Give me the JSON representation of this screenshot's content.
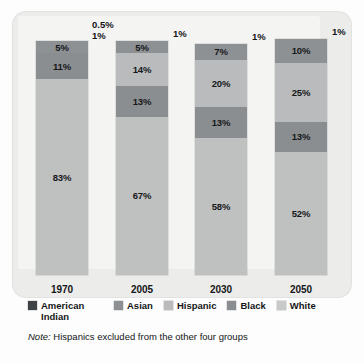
{
  "chart_data": {
    "type": "bar",
    "subtype": "stacked-100-percent",
    "title": "",
    "xlabel": "",
    "ylabel": "",
    "ylim": [
      0,
      100
    ],
    "grid": false,
    "legend_position": "bottom",
    "categories": [
      "1970",
      "2005",
      "2030",
      "2050"
    ],
    "series": [
      {
        "name": "American Indian",
        "color": "#3f4346",
        "values": [
          0.5,
          1,
          1,
          1
        ],
        "labels": [
          "0.5%",
          "1%",
          "1%",
          "1%"
        ],
        "label_outside": true
      },
      {
        "name": "Asian",
        "color": "#8e9194",
        "values": [
          1,
          5,
          7,
          10
        ],
        "labels": [
          "1%",
          "5%",
          "7%",
          "10%"
        ]
      },
      {
        "name": "Hispanic",
        "color": "#b9bbbc",
        "values": [
          5,
          14,
          20,
          25
        ],
        "labels": [
          "5%",
          "14%",
          "20%",
          "25%"
        ]
      },
      {
        "name": "Black",
        "color": "#8b8e90",
        "values": [
          11,
          13,
          13,
          13
        ],
        "labels": [
          "11%",
          "13%",
          "13%",
          "13%"
        ]
      },
      {
        "name": "White",
        "color": "#bfc1c1",
        "values": [
          83,
          67,
          58,
          52
        ],
        "labels": [
          "83%",
          "67%",
          "58%",
          "52%"
        ]
      }
    ],
    "bars": [
      {
        "year": "1970",
        "outside_labels": [
          "0.5%",
          "1%"
        ],
        "segments": [
          {
            "group": "Asian",
            "label": "5%",
            "value": 5,
            "show_label": true
          },
          {
            "group": "Black",
            "label": "11%",
            "value": 11,
            "show_label": true
          },
          {
            "group": "White",
            "label": "83%",
            "value": 83,
            "show_label": true
          }
        ]
      },
      {
        "year": "2005",
        "outside_labels": [
          "1%"
        ],
        "segments": [
          {
            "group": "Asian",
            "label": "5%",
            "value": 5,
            "show_label": true
          },
          {
            "group": "Hispanic",
            "label": "14%",
            "value": 14,
            "show_label": true
          },
          {
            "group": "Black",
            "label": "13%",
            "value": 13,
            "show_label": true
          },
          {
            "group": "White",
            "label": "67%",
            "value": 67,
            "show_label": true
          }
        ]
      },
      {
        "year": "2030",
        "outside_labels": [
          "1%"
        ],
        "segments": [
          {
            "group": "Asian",
            "label": "7%",
            "value": 7,
            "show_label": true
          },
          {
            "group": "Hispanic",
            "label": "20%",
            "value": 20,
            "show_label": true
          },
          {
            "group": "Black",
            "label": "13%",
            "value": 13,
            "show_label": true
          },
          {
            "group": "White",
            "label": "58%",
            "value": 58,
            "show_label": true
          }
        ]
      },
      {
        "year": "2050",
        "outside_labels": [
          "1%"
        ],
        "segments": [
          {
            "group": "Asian",
            "label": "10%",
            "value": 10,
            "show_label": true
          },
          {
            "group": "Hispanic",
            "label": "25%",
            "value": 25,
            "show_label": true
          },
          {
            "group": "Black",
            "label": "13%",
            "value": 13,
            "show_label": true
          },
          {
            "group": "White",
            "label": "52%",
            "value": 52,
            "show_label": true
          }
        ]
      }
    ]
  },
  "legend": {
    "items": [
      {
        "label": "American Indian",
        "color": "#3f4346"
      },
      {
        "label": "Asian",
        "color": "#8e9194"
      },
      {
        "label": "Hispanic",
        "color": "#b9bbbc"
      },
      {
        "label": "Black",
        "color": "#8b8e90"
      },
      {
        "label": "White",
        "color": "#c8caca"
      }
    ]
  },
  "note": {
    "prefix": "Note:",
    "text": "Hispanics excluded from the other four groups"
  }
}
